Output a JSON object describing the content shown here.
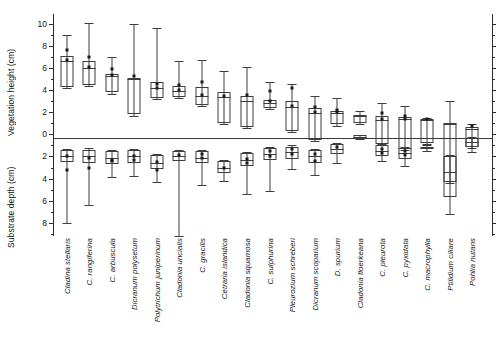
{
  "chart_data": {
    "type": "box",
    "title": "",
    "xlabel": "",
    "ylabel_upper": "Vegetation height (cm)",
    "ylabel_lower": "Substrate depth (cm)",
    "ylim": [
      -9.2,
      10.9
    ],
    "zero_reference": 0,
    "grid": false,
    "legend": "none",
    "y_axis_note": "Values above zero read as vegetation height (cm); values below zero read as substrate depth (cm) with labels shown as positive magnitudes",
    "yticks_major": [
      10,
      8,
      6,
      4,
      2,
      0,
      -2,
      -4,
      -6,
      -8
    ],
    "ytick_labels": [
      "10",
      "8",
      "6",
      "4",
      "2",
      "0",
      "2",
      "4",
      "6",
      "8"
    ],
    "ytick_minor_step": 1,
    "categories": [
      "Cladina stellaris",
      "C. rangiferina",
      "C. arbuscula",
      "Dicranum polysetum",
      "Polytrichum juniperinum",
      "Cladonia uncialis",
      "C. gracilis",
      "Cetraria islandica",
      "Cladonia squamosa",
      "C. sulphurina",
      "Pleurozium schreberi",
      "Dicranum scoparium",
      "D. spurium",
      "Cladonia floerkeana",
      "C. pleurota",
      "C. pyxidata",
      "C. macrophylla",
      "Ptilidium ciliare",
      "Pohlia nutans"
    ],
    "series": [
      {
        "name": "vegetation-height",
        "description": "Upper box plot, values in cm above zero line",
        "boxes": [
          {
            "category": "Cladina stellaris",
            "whisker_low": 4.2,
            "q1": 4.3,
            "median": 6.6,
            "q3": 7.1,
            "whisker_high": 9.0,
            "points": [
              7.6,
              6.7
            ]
          },
          {
            "category": "C. rangiferina",
            "whisker_low": 4.4,
            "q1": 4.5,
            "median": 6.0,
            "q3": 6.6,
            "whisker_high": 10.1,
            "points": [
              7.0,
              6.1
            ]
          },
          {
            "category": "C. arbuscula",
            "whisker_low": 3.7,
            "q1": 3.8,
            "median": 5.3,
            "q3": 5.5,
            "whisker_high": 7.0,
            "points": [
              5.9,
              5.4
            ]
          },
          {
            "category": "Dicranum polysetum",
            "whisker_low": 1.7,
            "q1": 1.8,
            "median": 5.0,
            "q3": 5.1,
            "whisker_high": 10.0,
            "points": [
              5.3
            ]
          },
          {
            "category": "Polytrichum juniperinum",
            "whisker_low": 3.2,
            "q1": 3.3,
            "median": 4.2,
            "q3": 4.7,
            "whisker_high": 9.6,
            "points": [
              4.6,
              4.2
            ]
          },
          {
            "category": "Cladonia uncialis",
            "whisker_low": 3.3,
            "q1": 3.4,
            "median": 3.9,
            "q3": 4.4,
            "whisker_high": 6.6,
            "points": [
              4.5,
              4.0
            ]
          },
          {
            "category": "C. gracilis",
            "whisker_low": 2.6,
            "q1": 2.7,
            "median": 3.5,
            "q3": 4.3,
            "whisker_high": 6.7,
            "points": [
              4.7,
              3.6
            ]
          },
          {
            "category": "Cetraria islandica",
            "whisker_low": 0.9,
            "q1": 1.0,
            "median": 3.4,
            "q3": 3.8,
            "whisker_high": 5.7,
            "points": [
              3.5
            ]
          },
          {
            "category": "Cladonia squamosa",
            "whisker_low": 0.6,
            "q1": 0.7,
            "median": 3.0,
            "q3": 3.5,
            "whisker_high": 6.1,
            "points": [
              3.6
            ]
          },
          {
            "category": "C. sulphurina",
            "whisker_low": 2.3,
            "q1": 2.4,
            "median": 2.8,
            "q3": 3.1,
            "whisker_high": 4.7,
            "points": [
              3.9,
              3.0
            ]
          },
          {
            "category": "Pleurozium schreberi",
            "whisker_low": 0.2,
            "q1": 0.3,
            "median": 2.5,
            "q3": 3.0,
            "whisker_high": 4.6,
            "points": [
              4.2,
              2.6
            ]
          },
          {
            "category": "Dicranum scoparium",
            "whisker_low": -0.6,
            "q1": -0.5,
            "median": 1.9,
            "q3": 2.4,
            "whisker_high": 3.5,
            "points": [
              2.5,
              2.0
            ]
          },
          {
            "category": "D. spurium",
            "whisker_low": 0.8,
            "q1": 0.9,
            "median": 1.9,
            "q3": 2.1,
            "whisker_high": 3.3,
            "points": [
              2.2,
              2.0
            ]
          },
          {
            "category": "Cladonia floerkeana",
            "whisker_low": 0.9,
            "q1": 1.0,
            "median": 1.7,
            "q3": 1.8,
            "whisker_high": 2.1,
            "points": []
          },
          {
            "category": "C. pleurota",
            "whisker_low": -1.0,
            "q1": -0.9,
            "median": 1.3,
            "q3": 1.7,
            "whisker_high": 2.8,
            "points": [
              1.9,
              1.4
            ]
          },
          {
            "category": "C. pyxidata",
            "whisker_low": -1.4,
            "q1": -1.3,
            "median": 1.4,
            "q3": 1.6,
            "whisker_high": 2.6,
            "points": [
              1.7,
              1.4
            ]
          },
          {
            "category": "C. macrophylla",
            "whisker_low": -0.9,
            "q1": -0.8,
            "median": 1.3,
            "q3": 1.4,
            "whisker_high": 1.5,
            "points": [
              1.4
            ]
          },
          {
            "category": "Ptilidium ciliare",
            "whisker_low": -4.4,
            "q1": -4.3,
            "median": 0.9,
            "q3": 1.0,
            "whisker_high": 3.0,
            "points": []
          },
          {
            "category": "Pohlia nutans",
            "whisker_low": -1.2,
            "q1": -1.1,
            "median": 0.5,
            "q3": 0.7,
            "whisker_high": 0.9,
            "points": [
              0.8
            ]
          }
        ]
      },
      {
        "name": "substrate-depth",
        "description": "Lower box plot, plotted below the zero line; magnitudes are depths in cm",
        "boxes": [
          {
            "category": "Cladina stellaris",
            "whisker_low": -2.5,
            "q1": -1.4,
            "median": -2.0,
            "q3": -2.5,
            "whisker_high": -1.3,
            "points": [
              2.0,
              3.2
            ],
            "extreme_low": 8.0
          },
          {
            "category": "C. rangiferina",
            "whisker_low": -2.6,
            "q1": -1.4,
            "median": -2.0,
            "q3": -2.6,
            "whisker_high": -1.2,
            "points": [
              2.1,
              3.0
            ],
            "extreme_low": 6.4
          },
          {
            "category": "C. arbuscula",
            "whisker_low": -2.7,
            "q1": -1.5,
            "median": -2.1,
            "q3": -2.7,
            "whisker_high": -1.4,
            "points": [
              2.3,
              2.4
            ],
            "extreme_low": 3.9
          },
          {
            "category": "Dicranum polysetum",
            "whisker_low": -2.6,
            "q1": -1.4,
            "median": -2.0,
            "q3": -2.6,
            "whisker_high": -1.3,
            "points": [
              2.0,
              2.3
            ],
            "extreme_low": 3.8
          },
          {
            "category": "Polytrichum juniperinum",
            "whisker_low": -3.1,
            "q1": -1.9,
            "median": -2.6,
            "q3": -3.1,
            "whisker_high": -1.8,
            "points": [
              2.5,
              3.2
            ],
            "extreme_low": 4.3
          },
          {
            "category": "Cladonia uncialis",
            "whisker_low": -2.4,
            "q1": -1.5,
            "median": -2.0,
            "q3": -2.4,
            "whisker_high": -1.4,
            "points": [
              1.9
            ],
            "extreme_low": 9.2
          },
          {
            "category": "C. gracilis",
            "whisker_low": -2.6,
            "q1": -1.5,
            "median": -2.1,
            "q3": -2.6,
            "whisker_high": -1.4,
            "points": [
              1.8,
              2.1
            ],
            "extreme_low": 4.6
          },
          {
            "category": "Cetraria islandica",
            "whisker_low": -3.5,
            "q1": -2.4,
            "median": -3.0,
            "q3": -3.5,
            "whisker_high": -2.3,
            "points": [
              3.0
            ],
            "extreme_low": 4.2
          },
          {
            "category": "Cladonia squamosa",
            "whisker_low": -2.9,
            "q1": -1.7,
            "median": -2.3,
            "q3": -2.9,
            "whisker_high": -1.6,
            "points": [
              2.2,
              2.6
            ],
            "extreme_low": 5.4
          },
          {
            "category": "C. sulphurina",
            "whisker_low": -2.3,
            "q1": -1.2,
            "median": -1.8,
            "q3": -2.3,
            "whisker_high": -1.1,
            "points": [
              1.5,
              2.0
            ],
            "extreme_low": 5.1
          },
          {
            "category": "Pleurozium schreberi",
            "whisker_low": -2.2,
            "q1": -1.1,
            "median": -1.6,
            "q3": -2.2,
            "whisker_high": -1.0,
            "points": [
              1.3,
              1.8
            ],
            "extreme_low": 3.1
          },
          {
            "category": "Dicranum scoparium",
            "whisker_low": -2.6,
            "q1": -1.4,
            "median": -2.0,
            "q3": -2.6,
            "whisker_high": -1.3,
            "points": [
              1.8,
              2.4
            ],
            "extreme_low": 3.7
          },
          {
            "category": "D. spurium",
            "whisker_low": -1.8,
            "q1": -0.9,
            "median": -1.3,
            "q3": -1.8,
            "whisker_high": -0.8,
            "points": [
              1.1
            ],
            "extreme_low": 2.6
          },
          {
            "category": "Cladonia floerkeana",
            "whisker_low": -0.4,
            "q1": -0.1,
            "median": -0.2,
            "q3": -0.4,
            "whisker_high": -0.1,
            "points": [],
            "extreme_low": 0.4
          },
          {
            "category": "C. pleurota",
            "whisker_low": -2.0,
            "q1": -1.0,
            "median": -1.5,
            "q3": -2.0,
            "whisker_high": -0.9,
            "points": [
              1.3,
              1.7
            ],
            "extreme_low": 2.4
          },
          {
            "category": "C. pyxidata",
            "whisker_low": -2.2,
            "q1": -1.2,
            "median": -1.7,
            "q3": -2.2,
            "whisker_high": -1.1,
            "points": [
              1.5,
              1.9
            ],
            "extreme_low": 2.9
          },
          {
            "category": "C. macrophylla",
            "whisker_low": -1.3,
            "q1": -1.1,
            "median": -1.2,
            "q3": -1.3,
            "whisker_high": -1.0,
            "points": [],
            "extreme_low": 1.5
          },
          {
            "category": "Ptilidium ciliare",
            "whisker_low": -5.7,
            "q1": -2.0,
            "median": -3.4,
            "q3": -5.7,
            "whisker_high": -1.9,
            "points": [],
            "extreme_low": 7.2
          },
          {
            "category": "Pohlia nutans",
            "whisker_low": -1.1,
            "q1": -0.3,
            "median": -0.7,
            "q3": -1.1,
            "whisker_high": -0.2,
            "points": [],
            "extreme_low": 1.6
          }
        ]
      }
    ]
  }
}
